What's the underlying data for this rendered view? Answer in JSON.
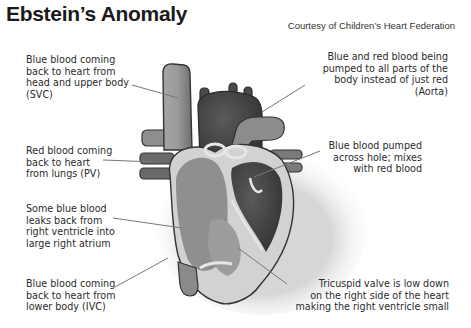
{
  "title": "Ebstein’s Anomaly",
  "credit": "Courtesy of Children’s Heart Federation",
  "labels": {
    "svc": "Blue blood coming\nback to heart from\nhead and upper body\n(SVC)",
    "aorta": "Blue and red blood being\npumped to all parts of the\nbody instead of just red\n(Aorta)",
    "pv": "Red blood coming\nback to heart\nfrom lungs (PV)",
    "hole": "Blue blood pumped\nacross hole; mixes\nwith red blood",
    "leak": "Some blue blood\nleaks back from\nright ventricle into\nlarge right atrium",
    "ivc": "Blue blood coming\nback to heart from\nlower body (IVC)",
    "tricuspid": "Tricuspid valve is low down\non the right side of the heart\nmaking the right ventricle small"
  },
  "colors": {
    "background": "#ffffff",
    "text": "#2b2b2b",
    "leader_line": "#777777",
    "blue_blood": "#8a8a8a",
    "red_blood": "#4a4a4a",
    "outline": "#3a3a3a",
    "wall": "#cfcfcf"
  }
}
